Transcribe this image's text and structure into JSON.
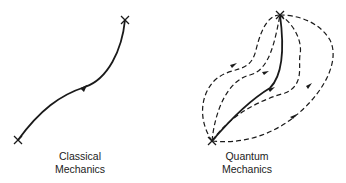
{
  "panels": [
    {
      "id": "classical",
      "label_line1": "Classical",
      "label_line2": "Mechanics"
    },
    {
      "id": "quantum",
      "label_line1": "Quantum",
      "label_line2": "Mechanics"
    }
  ],
  "colors": {
    "stroke": "#1a1a1a",
    "background": "#ffffff"
  }
}
